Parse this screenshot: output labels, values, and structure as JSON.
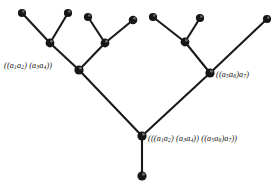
{
  "figure": {
    "background_color": "#ffffff",
    "line_color": "#1a1a1a",
    "node_color": "#161616",
    "width": 278,
    "height": 188
  },
  "labels": {
    "left_subtree": "((a1a2) (a3a4))",
    "right_subtree": "((a5a6)a7)",
    "root": "(((a1a2) (a3a4)) ((a5a6)a7))"
  },
  "nodes": [
    {
      "id": "leaf-a1",
      "name": "leaf-node-a1",
      "x": 22,
      "y": 13,
      "r": 4.1,
      "kind": "leaf"
    },
    {
      "id": "leaf-a2",
      "name": "leaf-node-a2",
      "x": 68,
      "y": 13,
      "r": 4.1,
      "kind": "leaf"
    },
    {
      "id": "leaf-a3",
      "name": "leaf-node-a3",
      "x": 88,
      "y": 17,
      "r": 4.1,
      "kind": "leaf"
    },
    {
      "id": "leaf-a4",
      "name": "leaf-node-a4",
      "x": 133,
      "y": 20,
      "r": 4.3,
      "kind": "leaf"
    },
    {
      "id": "leaf-a5",
      "name": "leaf-node-a5",
      "x": 153,
      "y": 17,
      "r": 4.1,
      "kind": "leaf"
    },
    {
      "id": "leaf-a6",
      "name": "leaf-node-a6",
      "x": 200,
      "y": 18,
      "r": 4.1,
      "kind": "leaf"
    },
    {
      "id": "leaf-a7",
      "name": "leaf-node-a7",
      "x": 267,
      "y": 19,
      "r": 4.1,
      "kind": "leaf"
    },
    {
      "id": "inner-a1a2",
      "name": "internal-node-a1a2",
      "x": 50,
      "y": 43,
      "r": 4.4,
      "kind": "internal"
    },
    {
      "id": "inner-a3a4",
      "name": "internal-node-a3a4",
      "x": 105,
      "y": 43,
      "r": 4.4,
      "kind": "internal"
    },
    {
      "id": "inner-a5a6",
      "name": "internal-node-a5a6",
      "x": 185,
      "y": 42,
      "r": 4.4,
      "kind": "internal"
    },
    {
      "id": "inner-left",
      "name": "internal-node-left",
      "x": 79,
      "y": 70,
      "r": 4.6,
      "kind": "internal"
    },
    {
      "id": "inner-right",
      "name": "internal-node-right",
      "x": 210,
      "y": 73,
      "r": 4.6,
      "kind": "internal"
    },
    {
      "id": "root",
      "name": "root-node",
      "x": 142,
      "y": 136,
      "r": 4.6,
      "kind": "internal"
    },
    {
      "id": "stem-end",
      "name": "stem-terminal-node",
      "x": 142,
      "y": 176,
      "r": 4.6,
      "kind": "leaf"
    }
  ],
  "edges": [
    {
      "name": "edge-a1-to-a1a2",
      "from": "leaf-a1",
      "to": "inner-a1a2"
    },
    {
      "name": "edge-a2-to-a1a2",
      "from": "leaf-a2",
      "to": "inner-a1a2"
    },
    {
      "name": "edge-a3-to-a3a4",
      "from": "leaf-a3",
      "to": "inner-a3a4"
    },
    {
      "name": "edge-a4-to-a3a4",
      "from": "leaf-a4",
      "to": "inner-a3a4"
    },
    {
      "name": "edge-a5-to-a5a6",
      "from": "leaf-a5",
      "to": "inner-a5a6"
    },
    {
      "name": "edge-a6-to-a5a6",
      "from": "leaf-a6",
      "to": "inner-a5a6"
    },
    {
      "name": "edge-a1a2-to-left",
      "from": "inner-a1a2",
      "to": "inner-left"
    },
    {
      "name": "edge-a3a4-to-left",
      "from": "inner-a3a4",
      "to": "inner-left"
    },
    {
      "name": "edge-a5a6-to-right",
      "from": "inner-a5a6",
      "to": "inner-right"
    },
    {
      "name": "edge-a7-to-right",
      "from": "leaf-a7",
      "to": "inner-right"
    },
    {
      "name": "edge-left-to-root",
      "from": "inner-left",
      "to": "root"
    },
    {
      "name": "edge-right-to-root",
      "from": "inner-right",
      "to": "root"
    },
    {
      "name": "edge-root-to-stem",
      "from": "root",
      "to": "stem-end"
    }
  ]
}
